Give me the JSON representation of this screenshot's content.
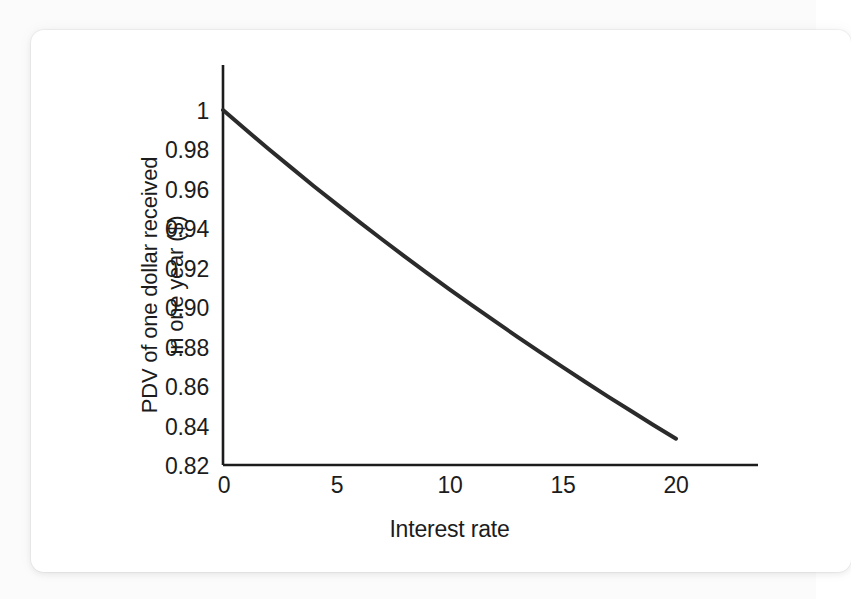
{
  "figure": {
    "background_color": "#fbfbfb",
    "card_color": "#ffffff",
    "ink_color": "#1c1c1c",
    "curve_color": "#2b2b2b"
  },
  "chart_data": {
    "type": "line",
    "title": "",
    "subtitle": "",
    "xlabel": "Interest rate",
    "ylabel_line1": "PDV of one dollar received",
    "ylabel_line2": "in one year ($)",
    "ylabel": "PDV of one dollar received in one year ($)",
    "xlim": [
      0,
      23.6
    ],
    "ylim": [
      0.82,
      1.0
    ],
    "xticks": [
      0,
      5,
      10,
      15,
      20
    ],
    "xticklabels": [
      "0",
      "5",
      "10",
      "15",
      "20"
    ],
    "yticks": [
      1,
      0.98,
      0.96,
      0.94,
      0.92,
      0.9,
      0.88,
      0.86,
      0.84,
      0.82
    ],
    "yticklabels": [
      "1",
      "0.98",
      "0.96",
      "0.94",
      "0.92",
      "0.90",
      "0.88",
      "0.86",
      "0.84",
      "0.82"
    ],
    "grid": false,
    "legend": false,
    "legend_position": "none",
    "axis_spines": [
      "left",
      "bottom"
    ],
    "series": [
      {
        "name": "PDV = 1 / (1 + r)",
        "color": "#2b2b2b",
        "linewidth": 4,
        "x": [
          0,
          1,
          2,
          3,
          4,
          5,
          6,
          7,
          8,
          9,
          10,
          11,
          12,
          13,
          14,
          15,
          16,
          17,
          18,
          19,
          20
        ],
        "values": [
          1.0,
          0.9901,
          0.9804,
          0.9709,
          0.9615,
          0.9524,
          0.9434,
          0.9346,
          0.9259,
          0.9174,
          0.9091,
          0.9009,
          0.8929,
          0.885,
          0.8772,
          0.8696,
          0.8621,
          0.8547,
          0.8475,
          0.8403,
          0.8333
        ]
      }
    ],
    "annotations": []
  }
}
